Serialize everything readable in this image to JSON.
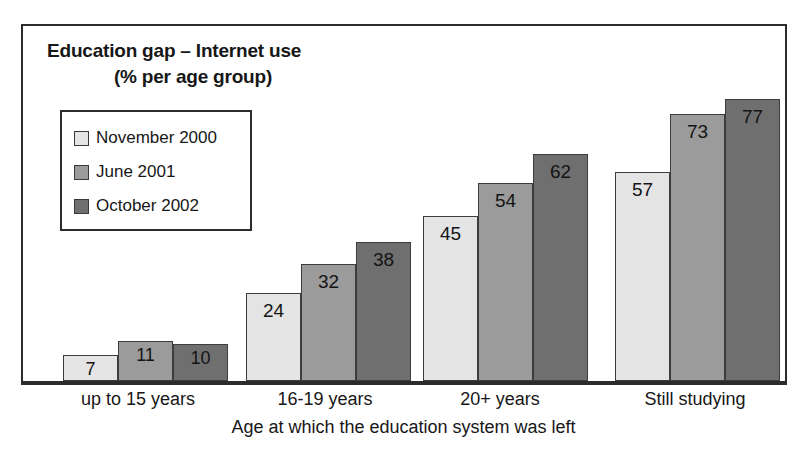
{
  "chart_data": {
    "type": "bar",
    "title": "Education gap – Internet use (% per age group)",
    "title_line_1": "Education gap – Internet use",
    "title_line_2": "(% per age group)",
    "xlabel": "Age at which the education system was left",
    "ylabel": "",
    "ylim": [
      0,
      80
    ],
    "grid": false,
    "legend_position": "upper-left",
    "categories": [
      "up to 15 years",
      "16-19 years",
      "20+ years",
      "Still studying"
    ],
    "series": [
      {
        "name": "November 2000",
        "color": "#e4e4e4",
        "values": [
          7,
          24,
          45,
          57
        ]
      },
      {
        "name": "June 2001",
        "color": "#9b9b9b",
        "values": [
          11,
          32,
          54,
          73
        ]
      },
      {
        "name": "October 2002",
        "color": "#6f6f6f",
        "values": [
          10,
          38,
          62,
          77
        ]
      }
    ]
  },
  "legend": {
    "items": [
      {
        "label": "November 2000",
        "color": "#e4e4e4"
      },
      {
        "label": "June 2001",
        "color": "#9b9b9b"
      },
      {
        "label": "October 2002",
        "color": "#6f6f6f"
      }
    ]
  },
  "groups": [
    {
      "label": "up to 15 years",
      "bars": [
        {
          "series": "November 2000",
          "value": 7,
          "label": "7"
        },
        {
          "series": "June 2001",
          "value": 11,
          "label": "11"
        },
        {
          "series": "October 2002",
          "value": 10,
          "label": "10"
        }
      ]
    },
    {
      "label": "16-19 years",
      "bars": [
        {
          "series": "November 2000",
          "value": 24,
          "label": "24"
        },
        {
          "series": "June 2001",
          "value": 32,
          "label": "32"
        },
        {
          "series": "October 2002",
          "value": 38,
          "label": "38"
        }
      ]
    },
    {
      "label": "20+ years",
      "bars": [
        {
          "series": "November 2000",
          "value": 45,
          "label": "45"
        },
        {
          "series": "June 2001",
          "value": 54,
          "label": "54"
        },
        {
          "series": "October 2002",
          "value": 62,
          "label": "62"
        }
      ]
    },
    {
      "label": "Still studying",
      "bars": [
        {
          "series": "November 2000",
          "value": 57,
          "label": "57"
        },
        {
          "series": "June 2001",
          "value": 73,
          "label": "73"
        },
        {
          "series": "October 2002",
          "value": 77,
          "label": "77"
        }
      ]
    }
  ],
  "axis": {
    "x_title": "Age at which the education system was left"
  },
  "layout": {
    "px_per_unit": 3.66,
    "bar_width": 55,
    "group_left_px": [
      40,
      223,
      400,
      592
    ]
  }
}
